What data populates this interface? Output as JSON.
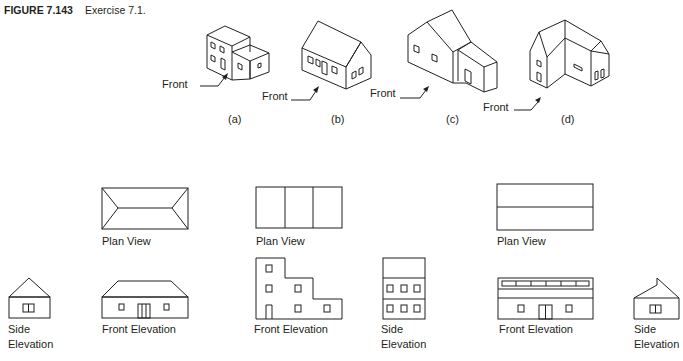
{
  "figure": {
    "number": "FIGURE 7.143",
    "caption": "Exercise 7.1."
  },
  "pictorials": [
    {
      "id": "a",
      "label": "(a)",
      "front_label": "Front"
    },
    {
      "id": "b",
      "label": "(b)",
      "front_label": "Front"
    },
    {
      "id": "c",
      "label": "(c)",
      "front_label": "Front"
    },
    {
      "id": "d",
      "label": "(d)",
      "front_label": "Front"
    }
  ],
  "orthographic_sets": [
    {
      "plan_label": "Plan View",
      "front_label": "Front Elevation",
      "side_label_1": "Side",
      "side_label_2": "Elevation"
    },
    {
      "plan_label": "Plan View",
      "front_label": "Front Elevation",
      "side_label_1": "Side",
      "side_label_2": "Elevation"
    },
    {
      "plan_label": "Plan View",
      "front_label": "Front Elevation",
      "side_label_1": "Side",
      "side_label_2": "Elevation"
    }
  ],
  "colors": {
    "line": "#231f20",
    "background": "#ffffff"
  }
}
